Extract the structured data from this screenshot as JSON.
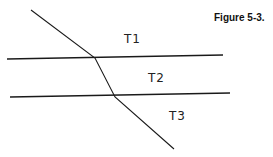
{
  "figure": {
    "caption": "Figure 5-3.",
    "layers": [
      {
        "label": "T1",
        "x": 124,
        "y": 32
      },
      {
        "label": "T2",
        "x": 148,
        "y": 71
      },
      {
        "label": "T3",
        "x": 169,
        "y": 109
      }
    ],
    "boundaries": [
      {
        "x1": 7,
        "y1": 59,
        "x2": 223,
        "y2": 55
      },
      {
        "x1": 10,
        "y1": 97,
        "x2": 230,
        "y2": 93
      }
    ],
    "ray": [
      [
        31,
        10
      ],
      [
        95,
        58
      ],
      [
        115,
        97
      ],
      [
        174,
        149
      ]
    ],
    "colors": {
      "line": "#1a1a1a"
    }
  }
}
